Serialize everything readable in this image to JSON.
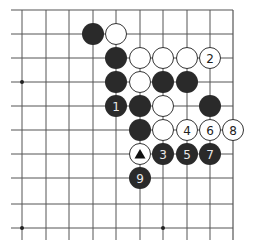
{
  "board": {
    "columns_x": [
      22,
      46,
      69,
      93,
      116,
      140,
      163,
      187,
      210,
      233
    ],
    "rows_y": [
      10,
      34,
      58,
      82,
      106,
      130,
      154,
      178,
      204,
      228
    ],
    "line_color": "#555555",
    "edges": {
      "top": true,
      "right": true,
      "left": false,
      "bottom": false
    },
    "star_points": [
      {
        "col": 0,
        "row": 3
      },
      {
        "col": 0,
        "row": 9
      },
      {
        "col": 6,
        "row": 9
      }
    ]
  },
  "stones": [
    {
      "col": 3,
      "row": 1,
      "color": "black",
      "label": ""
    },
    {
      "col": 4,
      "row": 1,
      "color": "white",
      "label": ""
    },
    {
      "col": 4,
      "row": 2,
      "color": "black",
      "label": ""
    },
    {
      "col": 5,
      "row": 2,
      "color": "white",
      "label": ""
    },
    {
      "col": 6,
      "row": 2,
      "color": "white",
      "label": ""
    },
    {
      "col": 7,
      "row": 2,
      "color": "white",
      "label": ""
    },
    {
      "col": 8,
      "row": 2,
      "color": "white",
      "label": "2"
    },
    {
      "col": 4,
      "row": 3,
      "color": "black",
      "label": ""
    },
    {
      "col": 5,
      "row": 3,
      "color": "white",
      "label": ""
    },
    {
      "col": 6,
      "row": 3,
      "color": "black",
      "label": ""
    },
    {
      "col": 7,
      "row": 3,
      "color": "black",
      "label": ""
    },
    {
      "col": 4,
      "row": 4,
      "color": "black",
      "label": "1"
    },
    {
      "col": 5,
      "row": 4,
      "color": "black",
      "label": ""
    },
    {
      "col": 6,
      "row": 4,
      "color": "white",
      "label": ""
    },
    {
      "col": 8,
      "row": 4,
      "color": "black",
      "label": ""
    },
    {
      "col": 5,
      "row": 5,
      "color": "black",
      "label": ""
    },
    {
      "col": 6,
      "row": 5,
      "color": "white",
      "label": ""
    },
    {
      "col": 7,
      "row": 5,
      "color": "white",
      "label": "4"
    },
    {
      "col": 8,
      "row": 5,
      "color": "white",
      "label": "6"
    },
    {
      "col": 9,
      "row": 5,
      "color": "white",
      "label": "8"
    },
    {
      "col": 5,
      "row": 6,
      "color": "white",
      "label": "",
      "marker": "triangle"
    },
    {
      "col": 6,
      "row": 6,
      "color": "black",
      "label": "3"
    },
    {
      "col": 7,
      "row": 6,
      "color": "black",
      "label": "5"
    },
    {
      "col": 8,
      "row": 6,
      "color": "black",
      "label": "7"
    },
    {
      "col": 5,
      "row": 7,
      "color": "black",
      "label": "9"
    }
  ],
  "colors": {
    "black_stone": "#2a2a2a",
    "white_stone": "#ffffff",
    "white_stroke": "#333333",
    "black_label": "#e8e8e8",
    "white_label": "#222222"
  }
}
